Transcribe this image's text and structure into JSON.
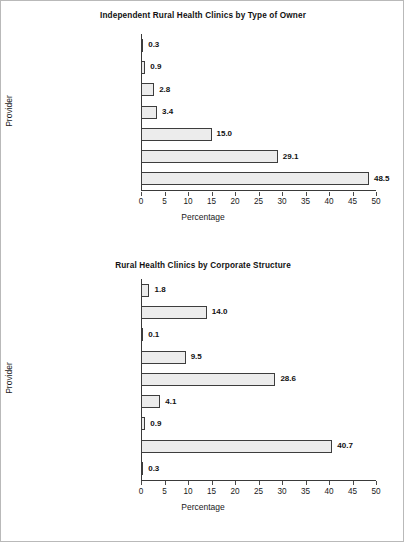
{
  "figure": {
    "background": "#ffffff",
    "frame_color": "#b9b9b9",
    "bar_fill": "#ececec",
    "bar_border": "#3d3d3d"
  },
  "chart_data": [
    {
      "type": "bar",
      "orientation": "horizontal",
      "title": "Independent Rural Health Clinics by Type of Owner",
      "xlabel": "Percentage",
      "ylabel": "Provider",
      "xlim": [
        0,
        50
      ],
      "xticks": [
        0,
        5,
        10,
        15,
        20,
        25,
        30,
        35,
        40,
        45,
        50
      ],
      "xtick_labels": [
        "0",
        "5",
        "10",
        "15",
        "20",
        "25",
        "30",
        "35",
        "40",
        "45",
        "50"
      ],
      "grid": false,
      "legend": "none",
      "categories": [
        "Certified nurse-midwife",
        "RHC corporation",
        "Physician assistant",
        "Nurse practitioner",
        "Hospital corporation",
        "Other",
        "Physician"
      ],
      "values": [
        0.3,
        0.9,
        2.8,
        3.4,
        15.0,
        29.1,
        48.5
      ],
      "value_labels": [
        "0.3",
        "0.9",
        "2.8",
        "3.4",
        "15.0",
        "29.1",
        "48.5"
      ]
    },
    {
      "type": "bar",
      "orientation": "horizontal",
      "title": "Rural Health Clinics by Corporate Structure",
      "xlabel": "Percentage",
      "ylabel": "Provider",
      "xlim": [
        0,
        50
      ],
      "xticks": [
        0,
        5,
        10,
        15,
        20,
        25,
        30,
        35,
        40,
        45,
        50
      ],
      "xtick_labels": [
        "0",
        "5",
        "10",
        "15",
        "20",
        "25",
        "30",
        "35",
        "40",
        "45",
        "50"
      ],
      "grid": false,
      "legend": "none",
      "categories": [
        "State government",
        "Local government",
        "Federal government",
        "For-profit individual",
        "For-profit corporation",
        "For-profit partnership",
        "Non-profit individual",
        "Non-profit corporation",
        "Non-profit partnership"
      ],
      "values": [
        1.8,
        14.0,
        0.1,
        9.5,
        28.6,
        4.1,
        0.9,
        40.7,
        0.3
      ],
      "value_labels": [
        "1.8",
        "14.0",
        "0.1",
        "9.5",
        "28.6",
        "4.1",
        "0.9",
        "40.7",
        "0.3"
      ]
    }
  ]
}
